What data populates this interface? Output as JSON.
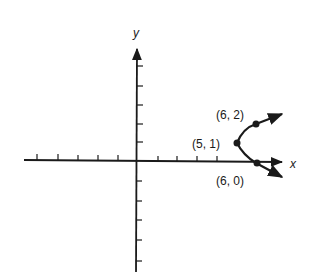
{
  "diagram": {
    "type": "coordinate-plane-parabola",
    "axes": {
      "x_label": "x",
      "y_label": "y",
      "x_ticks_negative": 5,
      "x_ticks_positive": 6,
      "y_ticks_positive": 5,
      "y_ticks_negative": 5
    },
    "curve": {
      "description": "parabola opening to the right with vertex at (5, 1)",
      "color": "#1a1a1a"
    },
    "points": [
      {
        "label": "(6, 2)",
        "x": 6,
        "y": 2
      },
      {
        "label": "(5, 1)",
        "x": 5,
        "y": 1
      },
      {
        "label": "(6, 0)",
        "x": 6,
        "y": 0
      }
    ]
  }
}
